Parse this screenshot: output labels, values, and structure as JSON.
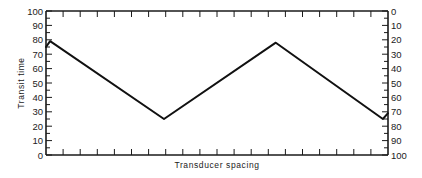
{
  "chart_data": {
    "type": "line",
    "title": "",
    "xlabel": "Transducer spacing",
    "ylabel": "Transit time",
    "ylim": [
      0,
      100
    ],
    "y_right_axis": {
      "ticks": [
        0,
        10,
        20,
        30,
        40,
        50,
        60,
        70,
        80,
        90,
        100
      ],
      "inverted": true
    },
    "y_left_ticks": [
      0,
      10,
      20,
      30,
      40,
      50,
      60,
      70,
      80,
      90,
      100
    ],
    "x_ticks_count": 20,
    "x_tick_labels": [],
    "grid": false,
    "legend": null,
    "series": [
      {
        "name": "Transit time",
        "x": [
          0,
          1.2,
          34.5,
          67.2,
          98.5,
          100
        ],
        "values": [
          75,
          79,
          25,
          78,
          25,
          29
        ]
      }
    ]
  },
  "labels": {
    "xlabel": "Transducer spacing",
    "ylabel": "Transit time"
  }
}
